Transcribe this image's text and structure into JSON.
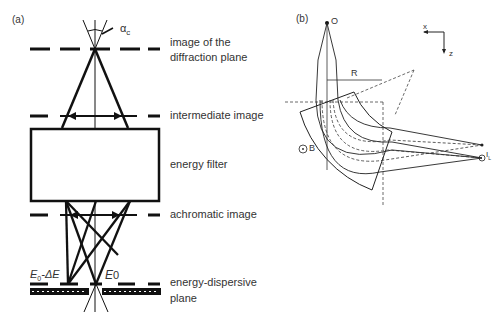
{
  "panel_a": {
    "label": "(a)",
    "alpha_label": "α",
    "alpha_sub": "c",
    "labels": {
      "diffraction_line1": "image of the",
      "diffraction_line2": "diffraction plane",
      "intermediate": "intermediate image",
      "filter": "energy filter",
      "achromatic": "achromatic image",
      "dispersive_line1": "energy-dispersive",
      "dispersive_line2": "plane"
    },
    "energy_left": "E",
    "energy_left_sub": "0",
    "energy_left_suffix": "-ΔE",
    "energy_right": "E",
    "energy_right_sub": "0"
  },
  "panel_b": {
    "label": "(b)",
    "point_O": "O",
    "radius_label": "R",
    "field_label": "B",
    "image_label": "I",
    "image_sub": "L",
    "axis_x": "x",
    "axis_z": "z"
  }
}
